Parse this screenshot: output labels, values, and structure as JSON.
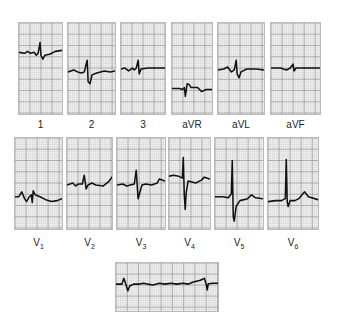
{
  "figure": {
    "type": "12-lead ECG with rhythm strip",
    "limb_leads": [
      {
        "label": "1",
        "x": 18,
        "y": 22,
        "w": 45,
        "h": 93,
        "baseline": 30,
        "trace": "M0,30 L6,31 L9,29 L12,31 L16,30 L18,33 L20,31 L22,20 L23,33 L25,37 L27,33 L32,32 L38,29 L45,28"
      },
      {
        "label": "2",
        "x": 67,
        "y": 22,
        "w": 49,
        "h": 93,
        "baseline": 50,
        "trace": "M0,50 L6,48 L10,50 L14,51 L17,50 L20,38 L21,60 L23,62 L25,53 L30,51 L38,49 L44,50 L49,49"
      },
      {
        "label": "3",
        "x": 120,
        "y": 22,
        "w": 46,
        "h": 93,
        "baseline": 47,
        "trace": "M0,47 L4,46 L8,49 L12,46 L14,48 L16,46 L18,38 L19,52 L21,47 L28,46 L46,46"
      },
      {
        "label": "aVR",
        "x": 171,
        "y": 22,
        "w": 42,
        "h": 93,
        "baseline": 67,
        "trace": "M0,67 L8,67 L11,68 L13,66 L14,75 L16,62 L18,63 L20,66 L27,66 L31,70 L36,68 L42,68"
      },
      {
        "label": "aVL",
        "x": 217,
        "y": 22,
        "w": 48,
        "h": 93,
        "baseline": 48,
        "trace": "M0,48 L6,47 L10,45 L14,50 L17,48 L19,38 L20,52 L22,56 L24,50 L30,47 L40,47 L48,48"
      },
      {
        "label": "aVF",
        "x": 270,
        "y": 22,
        "w": 51,
        "h": 93,
        "baseline": 46,
        "trace": "M0,46 L10,46 L16,48 L20,46 L23,42 L24,49 L26,46 L34,46 L51,46"
      }
    ],
    "limb_labels_y": 119,
    "chest_leads": [
      {
        "label": "V",
        "sub": "1",
        "x": 14,
        "y": 137,
        "w": 49,
        "h": 93,
        "trace": "M0,60 L4,60 L7,55 L10,62 L12,65 L15,60 L17,58 L18,66 L19,54 L21,58 L26,60 L32,63 L38,65 L44,64 L49,62"
      },
      {
        "label": "V",
        "sub": "2",
        "x": 66,
        "y": 137,
        "w": 47,
        "h": 93,
        "trace": "M0,48 L6,46 L9,49 L12,47 L16,47 L18,38 L20,52 L22,48 L26,46 L30,48 L38,49 L44,44 L47,40"
      },
      {
        "label": "V",
        "sub": "3",
        "x": 116,
        "y": 137,
        "w": 50,
        "h": 93,
        "trace": "M0,48 L6,47 L10,49 L14,48 L18,47 L20,33 L22,62 L24,55 L26,48 L30,47 L36,48 L42,46 L44,42 L50,44"
      },
      {
        "label": "V",
        "sub": "4",
        "x": 168,
        "y": 137,
        "w": 43,
        "h": 93,
        "trace": "M0,39 L5,38 L10,39 L14,41 L15,20 L16,58 L17,73 L18,56 L20,44 L24,45 L28,46 L34,43 L37,40 L43,42"
      },
      {
        "label": "V",
        "sub": "5",
        "x": 214,
        "y": 137,
        "w": 50,
        "h": 93,
        "trace": "M0,60 L8,60 L14,61 L17,57 L18,23 L19,80 L20,85 L22,70 L26,64 L34,62 L38,58 L42,61 L50,62"
      },
      {
        "label": "V",
        "sub": "6",
        "x": 267,
        "y": 137,
        "w": 52,
        "h": 93,
        "trace": "M0,65 L8,64 L14,64 L18,62 L19,22 L20,65 L21,70 L23,64 L28,64 L32,62 L38,55 L42,60 L52,63"
      }
    ],
    "chest_labels_y": 237,
    "rhythm_strip": {
      "x": 115,
      "y": 262,
      "w": 104,
      "h": 50,
      "trace": "M0,22 L6,22 L8,16 L10,22 L12,29 L14,24 L18,22 L24,22 L28,21 L32,22 L38,23 L44,21 L50,22 L56,21 L62,22 L68,21 L74,22 L78,20 L82,19 L86,18 L90,16 L92,22 L93,28 L94,22 L98,21 L104,21"
    },
    "colors": {
      "grid_minor": "#c8c8c8",
      "grid_major": "#888888",
      "trace": "#111111",
      "paper": "#f4f4f4"
    }
  }
}
